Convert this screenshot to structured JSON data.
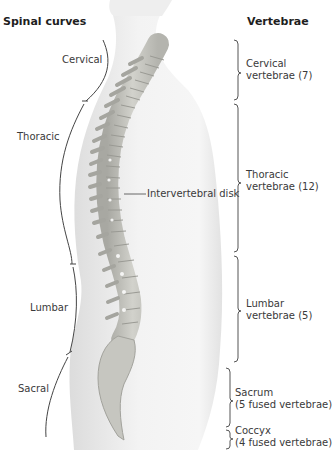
{
  "headings": {
    "left": "Spinal curves",
    "right": "Vertebrae"
  },
  "curves": [
    {
      "id": "cervical",
      "label": "Cervical"
    },
    {
      "id": "thoracic",
      "label": "Thoracic"
    },
    {
      "id": "lumbar",
      "label": "Lumbar"
    },
    {
      "id": "sacral",
      "label": "Sacral"
    }
  ],
  "vertebrae": [
    {
      "id": "cervical",
      "line1": "Cervical",
      "line2": "vertebrae (7)"
    },
    {
      "id": "thoracic",
      "line1": "Thoracic",
      "line2": "vertebrae (12)"
    },
    {
      "id": "lumbar",
      "line1": "Lumbar",
      "line2": "vertebrae (5)"
    },
    {
      "id": "sacrum",
      "line1": "Sacrum",
      "line2": "(5 fused vertebrae)"
    },
    {
      "id": "coccyx",
      "line1": "Coccyx",
      "line2": "(4 fused vertebrae)"
    }
  ],
  "callout": {
    "label": "Intervertebral disk"
  },
  "colors": {
    "body_silhouette": "#e9e9e9",
    "bone": "#c9c9c4",
    "bone_shadow": "#9e9e98",
    "disk": "#e4e4df",
    "line": "#444444"
  }
}
